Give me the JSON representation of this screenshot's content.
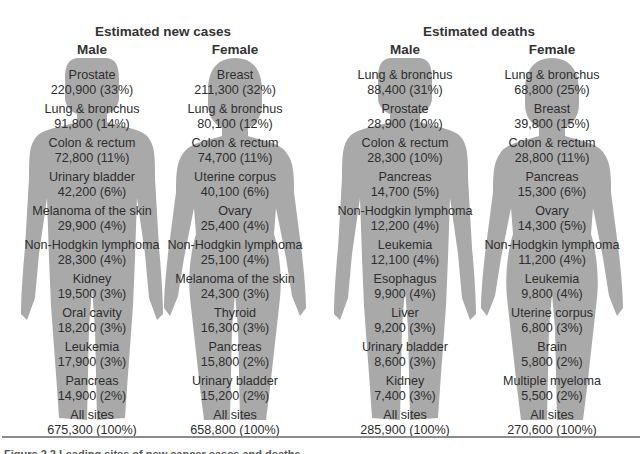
{
  "chart_data": {
    "type": "table",
    "title": "Leading sites of new cancer cases and deaths",
    "sections": [
      {
        "title": "Estimated new cases",
        "columns": [
          {
            "sex": "Male",
            "rows": [
              {
                "site": "Prostate",
                "count": 220900,
                "pct": 33
              },
              {
                "site": "Lung & bronchus",
                "count": 91800,
                "pct": 14
              },
              {
                "site": "Colon & rectum",
                "count": 72800,
                "pct": 11
              },
              {
                "site": "Urinary bladder",
                "count": 42200,
                "pct": 6
              },
              {
                "site": "Melanoma of the skin",
                "count": 29900,
                "pct": 4
              },
              {
                "site": "Non-Hodgkin lymphoma",
                "count": 28300,
                "pct": 4
              },
              {
                "site": "Kidney",
                "count": 19500,
                "pct": 3
              },
              {
                "site": "Oral cavity",
                "count": 18200,
                "pct": 3
              },
              {
                "site": "Leukemia",
                "count": 17900,
                "pct": 3
              },
              {
                "site": "Pancreas",
                "count": 14900,
                "pct": 2
              },
              {
                "site": "All sites",
                "count": 675300,
                "pct": 100
              }
            ]
          },
          {
            "sex": "Female",
            "rows": [
              {
                "site": "Breast",
                "count": 211300,
                "pct": 32
              },
              {
                "site": "Lung & bronchus",
                "count": 80100,
                "pct": 12
              },
              {
                "site": "Colon & rectum",
                "count": 74700,
                "pct": 11
              },
              {
                "site": "Uterine corpus",
                "count": 40100,
                "pct": 6
              },
              {
                "site": "Ovary",
                "count": 25400,
                "pct": 4
              },
              {
                "site": "Non-Hodgkin lymphoma",
                "count": 25100,
                "pct": 4
              },
              {
                "site": "Melanoma of the skin",
                "count": 24300,
                "pct": 3
              },
              {
                "site": "Thyroid",
                "count": 16300,
                "pct": 3
              },
              {
                "site": "Pancreas",
                "count": 15800,
                "pct": 2
              },
              {
                "site": "Urinary bladder",
                "count": 15200,
                "pct": 2
              },
              {
                "site": "All sites",
                "count": 658800,
                "pct": 100
              }
            ]
          }
        ]
      },
      {
        "title": "Estimated deaths",
        "columns": [
          {
            "sex": "Male",
            "rows": [
              {
                "site": "Lung & bronchus",
                "count": 88400,
                "pct": 31
              },
              {
                "site": "Prostate",
                "count": 28900,
                "pct": 10
              },
              {
                "site": "Colon & rectum",
                "count": 28300,
                "pct": 10
              },
              {
                "site": "Pancreas",
                "count": 14700,
                "pct": 5
              },
              {
                "site": "Non-Hodgkin lymphoma",
                "count": 12200,
                "pct": 4
              },
              {
                "site": "Leukemia",
                "count": 12100,
                "pct": 4
              },
              {
                "site": "Esophagus",
                "count": 9900,
                "pct": 4
              },
              {
                "site": "Liver",
                "count": 9200,
                "pct": 3
              },
              {
                "site": "Urinary bladder",
                "count": 8600,
                "pct": 3
              },
              {
                "site": "Kidney",
                "count": 7400,
                "pct": 3
              },
              {
                "site": "All sites",
                "count": 285900,
                "pct": 100
              }
            ]
          },
          {
            "sex": "Female",
            "rows": [
              {
                "site": "Lung & bronchus",
                "count": 68800,
                "pct": 25
              },
              {
                "site": "Breast",
                "count": 39800,
                "pct": 15
              },
              {
                "site": "Colon & rectum",
                "count": 28800,
                "pct": 11
              },
              {
                "site": "Pancreas",
                "count": 15300,
                "pct": 6
              },
              {
                "site": "Ovary",
                "count": 14300,
                "pct": 5
              },
              {
                "site": "Non-Hodgkin lymphoma",
                "count": 11200,
                "pct": 4
              },
              {
                "site": "Leukemia",
                "count": 9800,
                "pct": 4
              },
              {
                "site": "Uterine corpus",
                "count": 6800,
                "pct": 3
              },
              {
                "site": "Brain",
                "count": 5800,
                "pct": 2
              },
              {
                "site": "Multiple myeloma",
                "count": 5500,
                "pct": 2
              },
              {
                "site": "All sites",
                "count": 270600,
                "pct": 100
              }
            ]
          }
        ]
      }
    ]
  },
  "display": {
    "sections": [
      {
        "title": "Estimated new cases",
        "columns": [
          {
            "label": "Male",
            "entries": [
              {
                "site": "Prostate",
                "value": "220,900 (33%)"
              },
              {
                "site": "Lung & bronchus",
                "value": "91,800 (14%)"
              },
              {
                "site": "Colon & rectum",
                "value": "72,800 (11%)"
              },
              {
                "site": "Urinary bladder",
                "value": "42,200 (6%)"
              },
              {
                "site": "Melanoma of the skin",
                "value": "29,900 (4%)"
              },
              {
                "site": "Non-Hodgkin lymphoma",
                "value": "28,300 (4%)"
              },
              {
                "site": "Kidney",
                "value": "19,500 (3%)"
              },
              {
                "site": "Oral cavity",
                "value": "18,200 (3%)"
              },
              {
                "site": "Leukemia",
                "value": "17,900 (3%)"
              },
              {
                "site": "Pancreas",
                "value": "14,900 (2%)"
              },
              {
                "site": "All sites",
                "value": "675,300 (100%)"
              }
            ]
          },
          {
            "label": "Female",
            "entries": [
              {
                "site": "Breast",
                "value": "211,300 (32%)"
              },
              {
                "site": "Lung & bronchus",
                "value": "80,100 (12%)"
              },
              {
                "site": "Colon & rectum",
                "value": "74,700 (11%)"
              },
              {
                "site": "Uterine corpus",
                "value": "40,100 (6%)"
              },
              {
                "site": "Ovary",
                "value": "25,400 (4%)"
              },
              {
                "site": "Non-Hodgkin lymphoma",
                "value": "25,100 (4%)"
              },
              {
                "site": "Melanoma of the skin",
                "value": "24,300 (3%)"
              },
              {
                "site": "Thyroid",
                "value": "16,300 (3%)"
              },
              {
                "site": "Pancreas",
                "value": "15,800 (2%)"
              },
              {
                "site": "Urinary bladder",
                "value": "15,200 (2%)"
              },
              {
                "site": "All sites",
                "value": "658,800 (100%)"
              }
            ]
          }
        ]
      },
      {
        "title": "Estimated deaths",
        "columns": [
          {
            "label": "Male",
            "entries": [
              {
                "site": "Lung & bronchus",
                "value": "88,400 (31%)"
              },
              {
                "site": "Prostate",
                "value": "28,900 (10%)"
              },
              {
                "site": "Colon & rectum",
                "value": "28,300 (10%)"
              },
              {
                "site": "Pancreas",
                "value": "14,700 (5%)"
              },
              {
                "site": "Non-Hodgkin lymphoma",
                "value": "12,200 (4%)"
              },
              {
                "site": "Leukemia",
                "value": "12,100 (4%)"
              },
              {
                "site": "Esophagus",
                "value": "9,900 (4%)"
              },
              {
                "site": "Liver",
                "value": "9,200 (3%)"
              },
              {
                "site": "Urinary bladder",
                "value": "8,600 (3%)"
              },
              {
                "site": "Kidney",
                "value": "7,400 (3%)"
              },
              {
                "site": "All sites",
                "value": "285,900 (100%)"
              }
            ]
          },
          {
            "label": "Female",
            "entries": [
              {
                "site": "Lung & bronchus",
                "value": "68,800 (25%)"
              },
              {
                "site": "Breast",
                "value": "39,800 (15%)"
              },
              {
                "site": "Colon & rectum",
                "value": "28,800 (11%)"
              },
              {
                "site": "Pancreas",
                "value": "15,300 (6%)"
              },
              {
                "site": "Ovary",
                "value": "14,300 (5%)"
              },
              {
                "site": "Non-Hodgkin lymphoma",
                "value": "11,200 (4%)"
              },
              {
                "site": "Leukemia",
                "value": "9,800 (4%)"
              },
              {
                "site": "Uterine corpus",
                "value": "6,800 (3%)"
              },
              {
                "site": "Brain",
                "value": "5,800 (2%)"
              },
              {
                "site": "Multiple myeloma",
                "value": "5,500 (2%)"
              },
              {
                "site": "All sites",
                "value": "270,600 (100%)"
              }
            ]
          }
        ]
      }
    ],
    "silhouette_color": "#a9a9a9",
    "caption": "Figure 2.2 Leading sites of new cancer cases and deaths"
  }
}
